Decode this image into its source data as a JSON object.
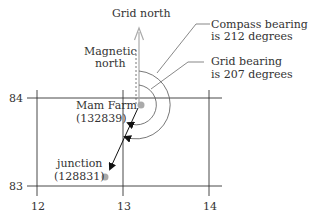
{
  "diagram": {
    "labels": {
      "grid_north": "Grid north",
      "magnetic_north_line1": "Magnetic",
      "magnetic_north_line2": "north",
      "compass_bearing_line1": "Compass bearing",
      "compass_bearing_line2": "is 212 degrees",
      "grid_bearing_line1": "Grid bearing",
      "grid_bearing_line2": "is 207 degrees"
    },
    "points": [
      {
        "name": "Mam Farm",
        "ref": "(132839)"
      },
      {
        "name": "junction",
        "ref": "(128831)"
      }
    ],
    "grid": {
      "eastings": [
        "12",
        "13",
        "14"
      ],
      "northings": [
        "84",
        "83"
      ]
    },
    "bearings": {
      "compass_degrees": 212,
      "grid_degrees": 207
    },
    "colors": {
      "line": "#333333",
      "point": "#aaaaaa",
      "grid_north_arrow": "#aaaaaa",
      "arc": "#555555"
    }
  }
}
